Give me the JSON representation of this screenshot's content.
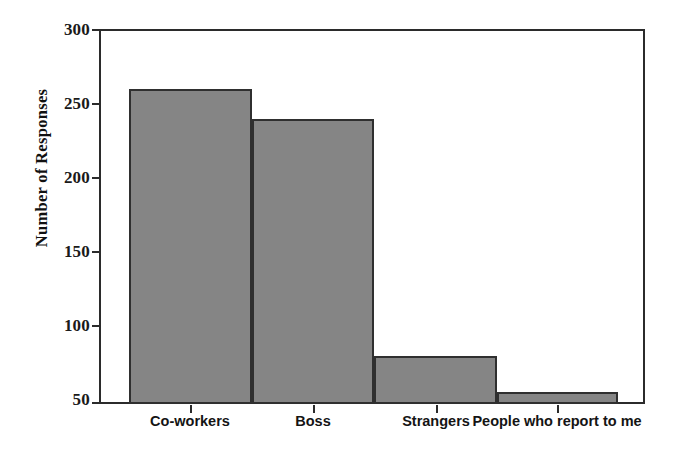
{
  "chart_data": {
    "type": "bar",
    "title": "",
    "xlabel": "",
    "ylabel": "Number of Responses",
    "categories": [
      "Co-workers",
      "Boss",
      "Strangers",
      "People who report to me"
    ],
    "values": [
      260,
      240,
      82,
      58
    ],
    "ylim": [
      50,
      300
    ],
    "yticks": [
      50,
      100,
      150,
      200,
      250,
      300
    ],
    "ytick_labels": [
      "50",
      "100",
      "150",
      "200",
      "250",
      "300"
    ],
    "grid": false,
    "legend": null,
    "bar_fill_color": "#858585",
    "bar_edge_color": "#2f2f2f",
    "axis_color": "#2b2b2b",
    "background_color": "#ffffff"
  },
  "axis": {
    "y_title": "Number of Responses",
    "y_tick_labels": [
      "300",
      "250",
      "200",
      "150",
      "100",
      "50"
    ],
    "x_tick_labels": [
      "Co-workers",
      "Boss",
      "Strangers",
      "People who report to me"
    ]
  }
}
